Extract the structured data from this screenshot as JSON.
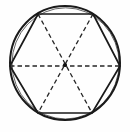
{
  "figure": {
    "caption": "",
    "background_color": "#fefefe",
    "stroke_color": "#1a1a1a",
    "dash_color": "#262626",
    "canvas": {
      "width": 130,
      "height": 132
    },
    "circle": {
      "name": "circumscribed-circle",
      "center_x": 65,
      "center_y": 63,
      "radius": 56,
      "radius_x": 55,
      "radius_y": 57,
      "stroke_width": 2.0,
      "style": "solid",
      "sketchy": true,
      "inner_offset": 1.4
    },
    "hexagon": {
      "name": "inscribed-hexagon",
      "sides": 6,
      "regular": true,
      "stroke_width": 1.7,
      "style": "solid",
      "vertices": [
        {
          "label": "top-left",
          "x": 38,
          "y": 14
        },
        {
          "label": "top-right",
          "x": 93,
          "y": 14
        },
        {
          "label": "right",
          "x": 120,
          "y": 66
        },
        {
          "label": "bottom-right",
          "x": 92,
          "y": 113
        },
        {
          "label": "bottom-left",
          "x": 38,
          "y": 113
        },
        {
          "label": "left",
          "x": 10,
          "y": 66
        }
      ],
      "points_attr": "38,14 93,14 120,66 92,113 38,113 10,66"
    },
    "diagonals": {
      "name": "main-diagonals",
      "count": 3,
      "style": "dashed",
      "stroke_width": 1.3,
      "dash_pattern": "4.5 3",
      "lines": [
        {
          "label": "horizontal-diagonal",
          "x1": 10,
          "y1": 66,
          "x2": 120,
          "y2": 66
        },
        {
          "label": "topleft-bottomright-diagonal",
          "x1": 38,
          "y1": 14,
          "x2": 92,
          "y2": 113
        },
        {
          "label": "topright-bottomleft-diagonal",
          "x1": 93,
          "y1": 14,
          "x2": 38,
          "y2": 113
        }
      ]
    },
    "center_point": {
      "name": "center-point",
      "x": 65,
      "y": 65,
      "radius": 2.1,
      "color": "#111111"
    }
  }
}
